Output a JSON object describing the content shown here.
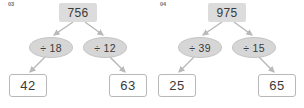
{
  "worksheet": {
    "problems": [
      {
        "number": "03",
        "dividend": "756",
        "operators": [
          {
            "symbol": "÷ 18"
          },
          {
            "symbol": "÷ 12"
          }
        ],
        "results": [
          {
            "value": "42"
          },
          {
            "value": "63"
          }
        ]
      },
      {
        "number": "04",
        "dividend": "975",
        "operators": [
          {
            "symbol": "÷ 39"
          },
          {
            "symbol": "÷ 15"
          }
        ],
        "results": [
          {
            "value": "25"
          },
          {
            "value": "65"
          }
        ]
      }
    ]
  },
  "colors": {
    "node_fill": "#dcdcdc",
    "ellipse_fill": "#d6d6d6",
    "box_border": "#b8b8b8",
    "arrow": "#b9b9b9",
    "text": "#3a3a3a",
    "label": "#6e6e6e",
    "background": "#ffffff"
  }
}
